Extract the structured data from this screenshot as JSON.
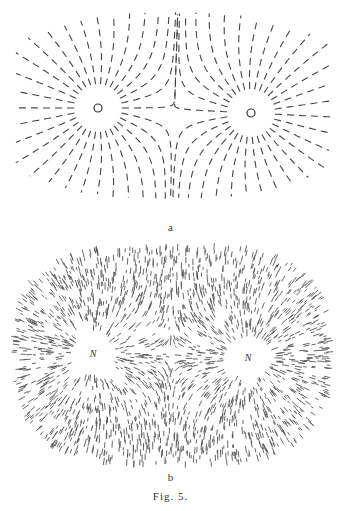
{
  "figure": {
    "caption": "Fig. 5.",
    "panels": [
      {
        "id": "a",
        "label": "a",
        "description": "Iron filings field lines between two like poles (small circles), sparse dashed lines",
        "poles": [
          {
            "x": 98,
            "y": 108,
            "marker": "circle"
          },
          {
            "x": 251,
            "y": 113,
            "marker": "circle"
          }
        ]
      },
      {
        "id": "b",
        "label": "b",
        "description": "Dense iron filings pattern between two north poles",
        "poles": [
          {
            "x": 93,
            "y": 354,
            "label": "N"
          },
          {
            "x": 248,
            "y": 358,
            "label": "N"
          }
        ]
      }
    ]
  },
  "colors": {
    "ink": "#333333",
    "background": "#ffffff"
  }
}
